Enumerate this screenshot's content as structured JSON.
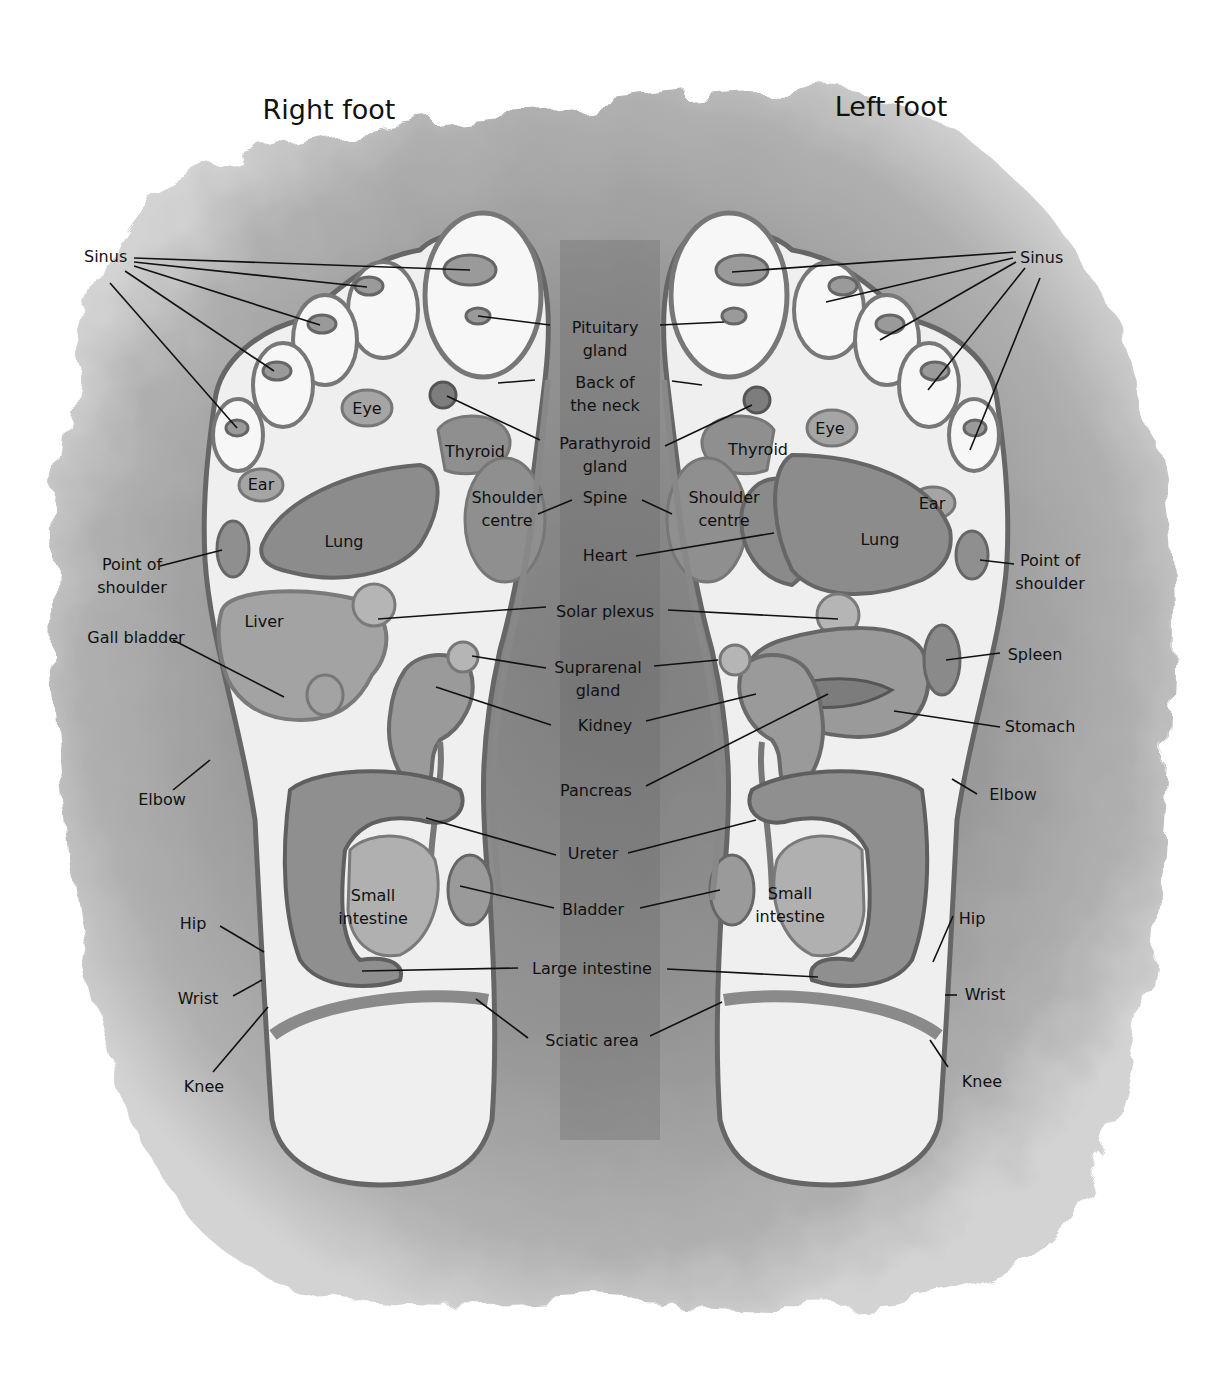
{
  "titles": {
    "right_foot": "Right foot",
    "left_foot": "Left foot"
  },
  "colors": {
    "wash": "#8a8a8a",
    "wash_light": "#b8b8b8",
    "foot_fill": "#efefef",
    "organ_fill": "#9a9a9a",
    "organ_stroke": "#6a6a6a",
    "line": "#111111"
  },
  "labels": [
    {
      "id": "sinus-right",
      "text": "Sinus",
      "x": 84,
      "y": 262,
      "anchor": "start",
      "lines": [
        [
          "Sinus"
        ]
      ],
      "leaders": [
        [
          134,
          258,
          470,
          270
        ],
        [
          134,
          262,
          367,
          287
        ],
        [
          134,
          266,
          320,
          325
        ],
        [
          125,
          271,
          274,
          371
        ],
        [
          110,
          283,
          237,
          428
        ]
      ]
    },
    {
      "id": "pituitary-gland",
      "text": "Pituitary gland",
      "x": 605,
      "y": 333,
      "anchor": "middle",
      "lines": [
        [
          "Pituitary"
        ],
        [
          "gland"
        ]
      ],
      "leaders": [
        [
          550,
          325,
          478,
          316
        ],
        [
          660,
          325,
          724,
          322
        ]
      ]
    },
    {
      "id": "back-of-the-neck",
      "text": "Back of the neck",
      "x": 605,
      "y": 388,
      "anchor": "middle",
      "lines": [
        [
          "Back of"
        ],
        [
          "the neck"
        ]
      ],
      "leaders": [
        [
          535,
          380,
          498,
          383
        ],
        [
          672,
          381,
          702,
          385
        ]
      ]
    },
    {
      "id": "parathyroid-gland",
      "text": "Parathyroid gland",
      "x": 605,
      "y": 449,
      "anchor": "middle",
      "lines": [
        [
          "Parathyroid"
        ],
        [
          "gland"
        ]
      ],
      "leaders": [
        [
          540,
          440,
          447,
          396
        ],
        [
          665,
          446,
          752,
          405
        ]
      ]
    },
    {
      "id": "spine",
      "text": "Spine",
      "x": 605,
      "y": 503,
      "anchor": "middle",
      "lines": [
        [
          "Spine"
        ]
      ],
      "leaders": [
        [
          572,
          500,
          538,
          514
        ],
        [
          642,
          500,
          672,
          514
        ]
      ]
    },
    {
      "id": "heart",
      "text": "Heart",
      "x": 605,
      "y": 561,
      "anchor": "middle",
      "lines": [
        [
          "Heart"
        ]
      ],
      "leaders": [
        [
          636,
          556,
          774,
          533
        ]
      ]
    },
    {
      "id": "solar-plexus",
      "text": "Solar plexus",
      "x": 605,
      "y": 617,
      "anchor": "middle",
      "lines": [
        [
          "Solar plexus"
        ]
      ],
      "leaders": [
        [
          546,
          607,
          378,
          619
        ],
        [
          668,
          610,
          838,
          619
        ]
      ]
    },
    {
      "id": "suprarenal-gland",
      "text": "Suprarenal gland",
      "x": 598,
      "y": 673,
      "anchor": "middle",
      "lines": [
        [
          "Suprarenal"
        ],
        [
          "gland"
        ]
      ],
      "leaders": [
        [
          546,
          668,
          472,
          656
        ],
        [
          654,
          666,
          718,
          660
        ]
      ]
    },
    {
      "id": "kidney",
      "text": "Kidney",
      "x": 605,
      "y": 731,
      "anchor": "middle",
      "lines": [
        [
          "Kidney"
        ]
      ],
      "leaders": [
        [
          551,
          725,
          436,
          687
        ],
        [
          646,
          721,
          756,
          694
        ]
      ]
    },
    {
      "id": "pancreas",
      "text": "Pancreas",
      "x": 596,
      "y": 796,
      "anchor": "middle",
      "lines": [
        [
          "Pancreas"
        ]
      ],
      "leaders": [
        [
          646,
          786,
          828,
          694
        ]
      ]
    },
    {
      "id": "ureter",
      "text": "Ureter",
      "x": 593,
      "y": 859,
      "anchor": "middle",
      "lines": [
        [
          "Ureter"
        ]
      ],
      "leaders": [
        [
          556,
          855,
          426,
          818
        ],
        [
          628,
          853,
          756,
          820
        ]
      ]
    },
    {
      "id": "bladder",
      "text": "Bladder",
      "x": 593,
      "y": 915,
      "anchor": "middle",
      "lines": [
        [
          "Bladder"
        ]
      ],
      "leaders": [
        [
          554,
          908,
          460,
          886
        ],
        [
          640,
          908,
          720,
          890
        ]
      ]
    },
    {
      "id": "large-intestine",
      "text": "Large intestine",
      "x": 592,
      "y": 974,
      "anchor": "middle",
      "lines": [
        [
          "Large intestine"
        ]
      ],
      "leaders": [
        [
          518,
          968,
          362,
          971
        ],
        [
          667,
          969,
          818,
          977
        ]
      ]
    },
    {
      "id": "sciatic-area",
      "text": "Sciatic area",
      "x": 592,
      "y": 1046,
      "anchor": "middle",
      "lines": [
        [
          "Sciatic area"
        ]
      ],
      "leaders": [
        [
          528,
          1038,
          476,
          999
        ],
        [
          650,
          1036,
          722,
          1002
        ]
      ]
    },
    {
      "id": "eye-right",
      "text": "Eye",
      "x": 367,
      "y": 414,
      "anchor": "middle",
      "lines": [
        [
          "Eye"
        ]
      ],
      "leaders": []
    },
    {
      "id": "ear-right",
      "text": "Ear",
      "x": 261,
      "y": 490,
      "anchor": "middle",
      "lines": [
        [
          "Ear"
        ]
      ],
      "leaders": []
    },
    {
      "id": "thyroid-right",
      "text": "Thyroid",
      "x": 475,
      "y": 457,
      "anchor": "middle",
      "lines": [
        [
          "Thyroid"
        ]
      ],
      "leaders": []
    },
    {
      "id": "shoulder-centre-right",
      "text": "Shoulder centre",
      "x": 507,
      "y": 503,
      "anchor": "middle",
      "lines": [
        [
          "Shoulder"
        ],
        [
          "centre"
        ]
      ],
      "leaders": []
    },
    {
      "id": "lung-right",
      "text": "Lung",
      "x": 344,
      "y": 547,
      "anchor": "middle",
      "lines": [
        [
          "Lung"
        ]
      ],
      "leaders": []
    },
    {
      "id": "liver",
      "text": "Liver",
      "x": 264,
      "y": 627,
      "anchor": "middle",
      "lines": [
        [
          "Liver"
        ]
      ],
      "leaders": []
    },
    {
      "id": "point-of-shoulder-right",
      "text": "Point of shoulder",
      "x": 132,
      "y": 570,
      "anchor": "middle",
      "lines": [
        [
          "Point of"
        ],
        [
          "shoulder"
        ]
      ],
      "leaders": [
        [
          160,
          566,
          222,
          550
        ]
      ]
    },
    {
      "id": "gall-bladder",
      "text": "Gall bladder",
      "x": 136,
      "y": 643,
      "anchor": "middle",
      "lines": [
        [
          "Gall bladder"
        ]
      ],
      "leaders": [
        [
          173,
          640,
          284,
          697
        ]
      ]
    },
    {
      "id": "elbow-right",
      "text": "Elbow",
      "x": 162,
      "y": 805,
      "anchor": "middle",
      "lines": [
        [
          "Elbow"
        ]
      ],
      "leaders": [
        [
          173,
          790,
          210,
          760
        ]
      ]
    },
    {
      "id": "small-intestine-right",
      "text": "Small intestine",
      "x": 373,
      "y": 901,
      "anchor": "middle",
      "lines": [
        [
          "Small"
        ],
        [
          "intestine"
        ]
      ],
      "leaders": []
    },
    {
      "id": "hip-right",
      "text": "Hip",
      "x": 193,
      "y": 929,
      "anchor": "middle",
      "lines": [
        [
          "Hip"
        ]
      ],
      "leaders": [
        [
          220,
          926,
          264,
          952
        ]
      ]
    },
    {
      "id": "wrist-right",
      "text": "Wrist",
      "x": 198,
      "y": 1004,
      "anchor": "middle",
      "lines": [
        [
          "Wrist"
        ]
      ],
      "leaders": [
        [
          233,
          996,
          262,
          980
        ]
      ]
    },
    {
      "id": "knee-right",
      "text": "Knee",
      "x": 204,
      "y": 1092,
      "anchor": "middle",
      "lines": [
        [
          "Knee"
        ]
      ],
      "leaders": [
        [
          213,
          1072,
          268,
          1007
        ]
      ]
    },
    {
      "id": "sinus-left",
      "text": "Sinus",
      "x": 1020,
      "y": 263,
      "anchor": "start",
      "lines": [
        [
          "Sinus"
        ]
      ],
      "leaders": [
        [
          1016,
          252,
          732,
          272
        ],
        [
          1013,
          258,
          826,
          302
        ],
        [
          1016,
          262,
          880,
          340
        ],
        [
          1025,
          268,
          928,
          390
        ],
        [
          1040,
          278,
          970,
          450
        ]
      ]
    },
    {
      "id": "eye-left",
      "text": "Eye",
      "x": 830,
      "y": 434,
      "anchor": "middle",
      "lines": [
        [
          "Eye"
        ]
      ],
      "leaders": []
    },
    {
      "id": "ear-left",
      "text": "Ear",
      "x": 932,
      "y": 509,
      "anchor": "middle",
      "lines": [
        [
          "Ear"
        ]
      ],
      "leaders": []
    },
    {
      "id": "thyroid-left",
      "text": "Thyroid",
      "x": 758,
      "y": 455,
      "anchor": "middle",
      "lines": [
        [
          "Thyroid"
        ]
      ],
      "leaders": []
    },
    {
      "id": "shoulder-centre-left",
      "text": "Shoulder centre",
      "x": 724,
      "y": 503,
      "anchor": "middle",
      "lines": [
        [
          "Shoulder"
        ],
        [
          "centre"
        ]
      ],
      "leaders": []
    },
    {
      "id": "lung-left",
      "text": "Lung",
      "x": 880,
      "y": 545,
      "anchor": "middle",
      "lines": [
        [
          "Lung"
        ]
      ],
      "leaders": []
    },
    {
      "id": "point-of-shoulder-left",
      "text": "Point of shoulder",
      "x": 1050,
      "y": 566,
      "anchor": "middle",
      "lines": [
        [
          "Point of"
        ],
        [
          "shoulder"
        ]
      ],
      "leaders": [
        [
          1014,
          564,
          980,
          560
        ]
      ]
    },
    {
      "id": "spleen",
      "text": "Spleen",
      "x": 1035,
      "y": 660,
      "anchor": "middle",
      "lines": [
        [
          "Spleen"
        ]
      ],
      "leaders": [
        [
          1000,
          653,
          946,
          660
        ]
      ]
    },
    {
      "id": "stomach",
      "text": "Stomach",
      "x": 1040,
      "y": 732,
      "anchor": "middle",
      "lines": [
        [
          "Stomach"
        ]
      ],
      "leaders": [
        [
          1000,
          727,
          894,
          711
        ]
      ]
    },
    {
      "id": "elbow-left",
      "text": "Elbow",
      "x": 1013,
      "y": 800,
      "anchor": "middle",
      "lines": [
        [
          "Elbow"
        ]
      ],
      "leaders": [
        [
          977,
          794,
          952,
          779
        ]
      ]
    },
    {
      "id": "small-intestine-left",
      "text": "Small intestine",
      "x": 790,
      "y": 899,
      "anchor": "middle",
      "lines": [
        [
          "Small"
        ],
        [
          "intestine"
        ]
      ],
      "leaders": []
    },
    {
      "id": "hip-left",
      "text": "Hip",
      "x": 972,
      "y": 924,
      "anchor": "middle",
      "lines": [
        [
          "Hip"
        ]
      ],
      "leaders": [
        [
          953,
          916,
          933,
          962
        ]
      ]
    },
    {
      "id": "wrist-left",
      "text": "Wrist",
      "x": 985,
      "y": 1000,
      "anchor": "middle",
      "lines": [
        [
          "Wrist"
        ]
      ],
      "leaders": [
        [
          957,
          995,
          945,
          995
        ]
      ]
    },
    {
      "id": "knee-left",
      "text": "Knee",
      "x": 982,
      "y": 1087,
      "anchor": "middle",
      "lines": [
        [
          "Knee"
        ]
      ],
      "leaders": [
        [
          948,
          1067,
          930,
          1040
        ]
      ]
    }
  ]
}
